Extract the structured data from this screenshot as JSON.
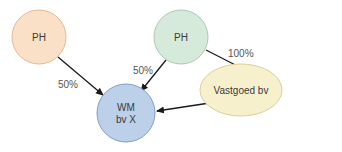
{
  "diagram": {
    "nodes": [
      {
        "id": "ph_left",
        "label": "PH",
        "fill": "#fbe0c8",
        "stroke": "#e8b890"
      },
      {
        "id": "ph_right",
        "label": "PH",
        "fill": "#d6eadb",
        "stroke": "#a9cbb0"
      },
      {
        "id": "wm",
        "label_line1": "WM",
        "label_line2": "bv X",
        "fill": "#bcd0ea",
        "stroke": "#7f9fc9"
      },
      {
        "id": "vastgoed",
        "label": "Vastgoed bv",
        "fill": "#f7f0cc",
        "stroke": "#ddd09a"
      }
    ],
    "edges": [
      {
        "from": "ph_left",
        "to": "wm",
        "label": "50%"
      },
      {
        "from": "ph_right",
        "to": "wm",
        "label": "50%"
      },
      {
        "from": "ph_right",
        "to": "vastgoed",
        "label": "100%"
      },
      {
        "from": "vastgoed",
        "to": "wm",
        "label": ""
      }
    ]
  }
}
